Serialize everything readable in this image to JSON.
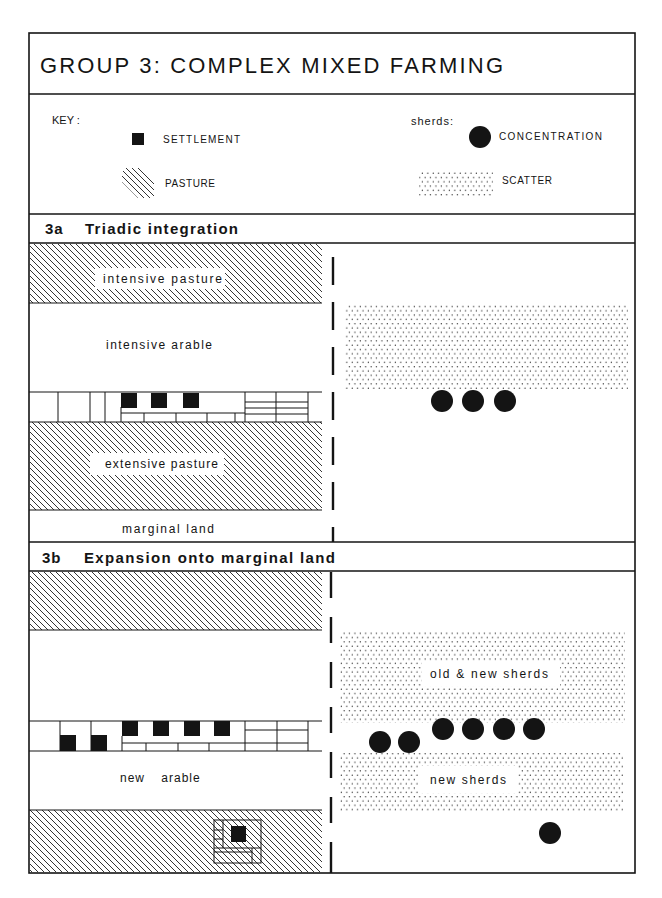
{
  "title": "GROUP 3: COMPLEX MIXED FARMING",
  "key": {
    "label": "KEY :",
    "settlement": "SETTLEMENT",
    "pasture": "PASTURE",
    "sherds_label": "sherds:",
    "concentration": "CONCENTRATION",
    "scatter": "SCATTER"
  },
  "panel_3a": {
    "number": "3a",
    "heading": "Triadic integration",
    "labels": {
      "intensive_pasture": "intensive pasture",
      "intensive_arable": "intensive arable",
      "extensive_pasture": "extensive pasture",
      "marginal_land": "marginal land"
    },
    "settlement_count": 3,
    "concentration_count": 3,
    "scatter_zones": 1
  },
  "panel_3b": {
    "number": "3b",
    "heading": "Expansion onto marginal land",
    "labels": {
      "new_arable": "new arable",
      "old_new_sherds": "old & new sherds",
      "new_sherds": "new sherds"
    },
    "settlement_count": 7,
    "concentration_count": 7,
    "scatter_zones": 2
  },
  "colors": {
    "ink": "#141414",
    "paper": "#ffffff"
  }
}
